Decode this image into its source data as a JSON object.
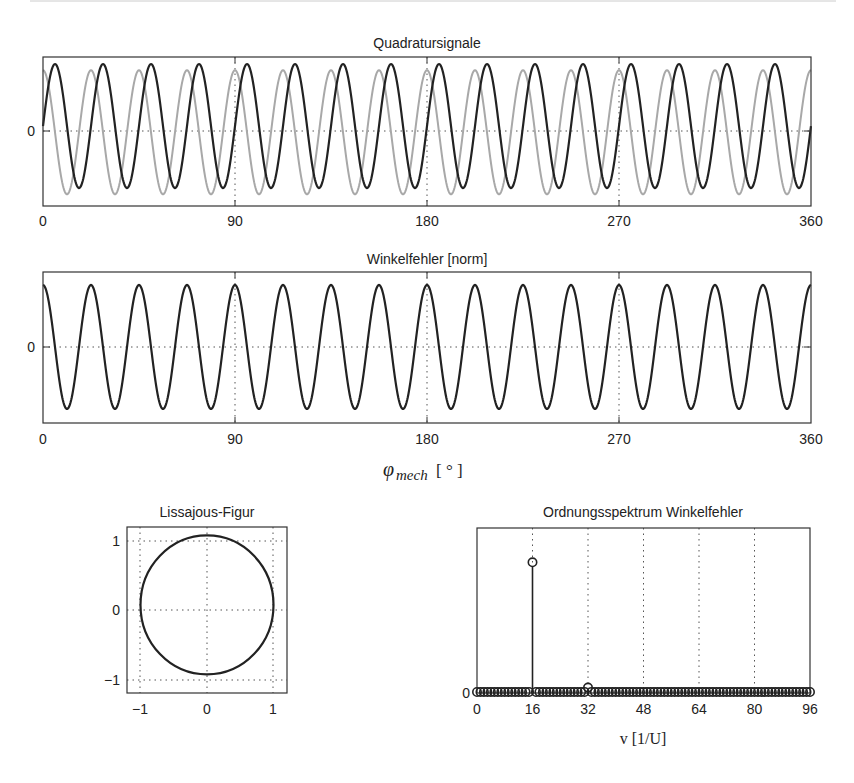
{
  "chart_data": [
    {
      "id": "quadrature",
      "type": "line",
      "title": "Quadratursignale",
      "xlabel": "",
      "ylabel": "",
      "xlim": [
        0,
        360
      ],
      "x_ticks": [
        0,
        90,
        180,
        270,
        360
      ],
      "y_ticks": [
        0
      ],
      "grid": true,
      "periods": 16,
      "series": [
        {
          "name": "sin-track",
          "color": "#222222",
          "function": "sin",
          "amplitude": 1.0,
          "offset": 0.08
        },
        {
          "name": "cos-track",
          "color": "#a8a8a8",
          "function": "cos",
          "amplitude": 1.0,
          "offset": -0.02
        }
      ]
    },
    {
      "id": "angle-error",
      "type": "line",
      "title": "Winkelfehler [norm]",
      "xlabel": "φ_mech [°]",
      "ylabel": "",
      "xlim": [
        0,
        360
      ],
      "x_ticks": [
        0,
        90,
        180,
        270,
        360
      ],
      "y_ticks": [
        0
      ],
      "grid": true,
      "periods": 16,
      "series": [
        {
          "name": "angle-error",
          "color": "#222222",
          "function": "cos",
          "amplitude": 1.0,
          "offset": 0
        }
      ]
    },
    {
      "id": "lissajous",
      "type": "line",
      "title": "Lissajous-Figur",
      "xlabel": "",
      "ylabel": "",
      "xlim": [
        -1.2,
        1.2
      ],
      "ylim": [
        -1.2,
        1.2
      ],
      "x_ticks": [
        -1,
        0,
        1
      ],
      "y_ticks": [
        -1,
        0,
        1
      ],
      "grid": true,
      "circle": {
        "center_x": 0,
        "center_y": 0.08,
        "radius": 1.0
      }
    },
    {
      "id": "order-spectrum",
      "type": "bar",
      "subtype": "stem",
      "title": "Ordnungsspektrum Winkelfehler",
      "xlabel": "v [1/U]",
      "ylabel": "",
      "xlim": [
        0,
        96
      ],
      "ylim": [
        0,
        1.1
      ],
      "x_ticks": [
        0,
        16,
        32,
        48,
        64,
        80,
        96
      ],
      "y_ticks": [
        0
      ],
      "grid": true,
      "orders": [
        0,
        96
      ],
      "peaks": [
        {
          "order": 16,
          "value": 0.87
        },
        {
          "order": 32,
          "value": 0.03
        }
      ]
    }
  ],
  "labels": {
    "quadrature_title": "Quadratursignale",
    "error_title": "Winkelfehler [norm]",
    "xlabel_main_symbol": "φ",
    "xlabel_main_sub": "mech",
    "xlabel_main_unit": "[ ° ]",
    "lissajous_title": "Lissajous-Figur",
    "spectrum_title": "Ordnungsspektrum Winkelfehler",
    "spectrum_xlabel": "v [1/U]",
    "tick_0": "0",
    "tick_90": "90",
    "tick_180": "180",
    "tick_270": "270",
    "tick_360": "360",
    "tick_m1": "−1",
    "tick_1": "1",
    "tick_16": "16",
    "tick_32": "32",
    "tick_48": "48",
    "tick_64": "64",
    "tick_80": "80",
    "tick_96": "96"
  }
}
